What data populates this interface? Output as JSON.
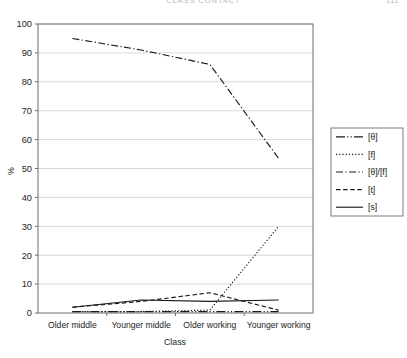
{
  "page_header": {
    "title": "CLASS CONTACT",
    "folio": "111"
  },
  "chart_data": {
    "type": "line",
    "title": "",
    "xlabel": "Class",
    "ylabel": "%",
    "ylim": [
      0,
      100
    ],
    "ytick_step": 10,
    "yticks": [
      "0",
      "10",
      "20",
      "30",
      "40",
      "50",
      "60",
      "70",
      "80",
      "90",
      "100"
    ],
    "grid": true,
    "legend_position": "right",
    "categories": [
      "Older middle",
      "Younger middle",
      "Older working",
      "Younger working"
    ],
    "series": [
      {
        "name": "[θ]",
        "dash": "long-dot",
        "values": [
          0.5,
          0.5,
          0.5,
          0.5
        ]
      },
      {
        "name": "[f]",
        "dash": "dotted",
        "values": [
          0.5,
          0.5,
          1.0,
          30.0
        ]
      },
      {
        "name": "[θ]/[f]",
        "dash": "dash-dot",
        "values": [
          95.0,
          91.0,
          86.0,
          53.5
        ]
      },
      {
        "name": "[t]",
        "dash": "dashed",
        "values": [
          2.0,
          4.0,
          7.0,
          1.0
        ]
      },
      {
        "name": "[s]",
        "dash": "solid",
        "values": [
          2.0,
          4.5,
          4.0,
          4.5
        ]
      }
    ]
  },
  "colors": {
    "line": "#1a1a1a",
    "grid": "#c9c9c9",
    "axis": "#6e6e6e",
    "plot_background": "#ffffff",
    "legend_border": "#7a7a7a"
  }
}
